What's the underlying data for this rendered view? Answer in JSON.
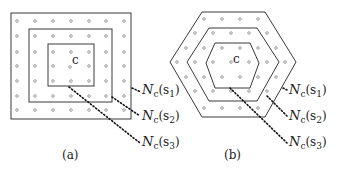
{
  "diagram": {
    "panel_a": {
      "caption": "(a)",
      "shape": "square",
      "center_label": "c",
      "labels": [
        {
          "main": "N",
          "sub": "c",
          "arg": "(s",
          "arg_sub": "1",
          "close": ")"
        },
        {
          "main": "N",
          "sub": "c",
          "arg": "(s",
          "arg_sub": "2",
          "close": ")"
        },
        {
          "main": "N",
          "sub": "c",
          "arg": "(s",
          "arg_sub": "3",
          "close": ")"
        }
      ]
    },
    "panel_b": {
      "caption": "(b)",
      "shape": "hexagon",
      "center_label": "c",
      "labels": [
        {
          "main": "N",
          "sub": "c",
          "arg": "(s",
          "arg_sub": "1",
          "close": ")"
        },
        {
          "main": "N",
          "sub": "c",
          "arg": "(s",
          "arg_sub": "2",
          "close": ")"
        },
        {
          "main": "N",
          "sub": "c",
          "arg": "(s",
          "arg_sub": "3",
          "close": ")"
        }
      ]
    }
  }
}
